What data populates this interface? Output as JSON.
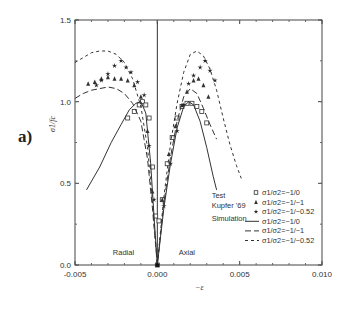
{
  "panel_label": "a)",
  "chart_data": {
    "type": "line",
    "title": "",
    "xlabel": "−ε",
    "ylabel": "σ1/fc",
    "xlim": [
      -0.005,
      0.01
    ],
    "ylim": [
      0.0,
      1.5
    ],
    "xticks": [
      -0.005,
      0.0,
      0.005,
      0.01
    ],
    "xtick_labels": [
      "-0.005",
      "0.000",
      "0.005",
      "0.010"
    ],
    "yticks": [
      0.0,
      0.5,
      1.0,
      1.5
    ],
    "ytick_labels": [
      "0.0",
      "0.5",
      "1.0",
      "1.5"
    ],
    "grid": false,
    "vertical_line_at": 0.0,
    "annotations": [
      {
        "text": "Radial",
        "x": -0.0027,
        "y": 0.06
      },
      {
        "text": "Axial",
        "x": 0.0013,
        "y": 0.06
      },
      {
        "text": "Test",
        "x": 0.0033,
        "y": 0.41
      },
      {
        "text": "Kupfer '69",
        "x": 0.0033,
        "y": 0.35
      },
      {
        "text": "Simulation",
        "x": 0.0033,
        "y": 0.27
      }
    ],
    "legend": {
      "position": "lower right",
      "entries": [
        {
          "label": "σ1/σ2=−1/0",
          "kind": "marker",
          "marker": "square"
        },
        {
          "label": "σ1/σ2=−1/−1",
          "kind": "marker",
          "marker": "triangle"
        },
        {
          "label": "σ1/σ2=−1/−0.52",
          "kind": "marker",
          "marker": "star"
        },
        {
          "label": "σ1/σ2=−1/0",
          "kind": "line",
          "dash": "solid"
        },
        {
          "label": "σ1/σ2=−1/−1",
          "kind": "line",
          "dash": "longdash"
        },
        {
          "label": "σ1/σ2=−1/−0.52",
          "kind": "line",
          "dash": "shortdash"
        }
      ]
    },
    "series": [
      {
        "name": "Test σ1/σ2=−1/0",
        "kind": "marker",
        "marker": "square",
        "x": [
          -0.0018,
          -0.0014,
          -0.0011,
          -0.0009,
          -0.0007,
          -0.0005,
          -0.0003,
          -0.0001,
          0.0,
          0.0001,
          0.0003,
          0.0006,
          0.0009,
          0.0012,
          0.0015,
          0.0018,
          0.0021,
          0.0024,
          0.0027,
          0.003
        ],
        "y": [
          0.9,
          0.94,
          0.98,
          1.0,
          0.98,
          0.9,
          0.6,
          0.3,
          0.0,
          0.27,
          0.4,
          0.62,
          0.78,
          0.9,
          0.97,
          0.99,
          0.99,
          0.97,
          0.94,
          0.87
        ]
      },
      {
        "name": "Test σ1/σ2=−1/−1",
        "kind": "marker",
        "marker": "triangle",
        "x": [
          -0.0042,
          -0.0038,
          -0.0034,
          -0.003,
          -0.0026,
          -0.0022,
          -0.0018,
          -0.0014,
          -0.001,
          -0.0006,
          -0.0003,
          0.0,
          0.0003,
          0.0007,
          0.0011,
          0.0015,
          0.0018,
          0.0022,
          0.0025,
          0.0028,
          0.0031
        ],
        "y": [
          1.11,
          1.12,
          1.14,
          1.15,
          1.14,
          1.14,
          1.13,
          1.1,
          1.03,
          0.82,
          0.45,
          0.0,
          0.4,
          0.68,
          0.85,
          0.98,
          1.06,
          1.13,
          1.14,
          1.1,
          1.03
        ]
      },
      {
        "name": "Test σ1/σ2=−1/−0.52",
        "kind": "marker",
        "marker": "star",
        "x": [
          -0.0037,
          -0.0034,
          -0.003,
          -0.0026,
          -0.0022,
          -0.0019,
          -0.0016,
          -0.0012,
          -0.0008,
          -0.0005,
          -0.0002,
          0.0,
          0.0004,
          0.0008,
          0.0012,
          0.0016,
          0.0019,
          0.0022,
          0.0026,
          0.0029,
          0.0032,
          0.0035
        ],
        "y": [
          1.1,
          1.13,
          1.17,
          1.22,
          1.25,
          1.21,
          1.18,
          1.12,
          1.04,
          0.73,
          0.4,
          0.0,
          0.36,
          0.62,
          0.82,
          0.98,
          1.11,
          1.16,
          1.21,
          1.25,
          1.19,
          1.13
        ]
      },
      {
        "name": "Simulation σ1/σ2=−1/0",
        "kind": "line",
        "dash": "solid",
        "x": [
          -0.0043,
          -0.0035,
          -0.0028,
          -0.0022,
          -0.0017,
          -0.0013,
          -0.001,
          -0.0007,
          -0.0004,
          -0.0002,
          0.0,
          0.0004,
          0.0008,
          0.0012,
          0.0016,
          0.0019,
          0.0022,
          0.0026,
          0.003,
          0.0034,
          0.0036
        ],
        "y": [
          0.46,
          0.6,
          0.75,
          0.86,
          0.95,
          0.99,
          1.0,
          0.93,
          0.62,
          0.3,
          0.0,
          0.35,
          0.62,
          0.84,
          0.97,
          1.0,
          0.98,
          0.88,
          0.72,
          0.54,
          0.46
        ]
      },
      {
        "name": "Simulation σ1/σ2=−1/−1",
        "kind": "line",
        "dash": "longdash",
        "x": [
          -0.005,
          -0.0045,
          -0.004,
          -0.0035,
          -0.003,
          -0.0025,
          -0.002,
          -0.0015,
          -0.001,
          -0.0006,
          -0.0003,
          0.0,
          0.0004,
          0.0008,
          0.0012,
          0.0016,
          0.002,
          0.0024,
          0.0028,
          0.0032,
          0.0036
        ],
        "y": [
          1.02,
          1.05,
          1.07,
          1.08,
          1.09,
          1.08,
          1.05,
          0.99,
          0.88,
          0.65,
          0.35,
          0.0,
          0.38,
          0.66,
          0.88,
          1.03,
          1.08,
          1.05,
          0.96,
          0.86,
          0.77
        ]
      },
      {
        "name": "Simulation σ1/σ2=−1/−0.52",
        "kind": "line",
        "dash": "shortdash",
        "x": [
          -0.005,
          -0.0045,
          -0.004,
          -0.0035,
          -0.003,
          -0.0025,
          -0.002,
          -0.0015,
          -0.001,
          -0.0006,
          -0.0003,
          0.0,
          0.0004,
          0.0008,
          0.0012,
          0.0016,
          0.002,
          0.0024,
          0.0028,
          0.0032,
          0.0036,
          0.004,
          0.0044,
          0.0048,
          0.0051
        ],
        "y": [
          1.24,
          1.27,
          1.3,
          1.31,
          1.31,
          1.29,
          1.24,
          1.14,
          0.97,
          0.72,
          0.4,
          0.0,
          0.42,
          0.74,
          0.99,
          1.18,
          1.29,
          1.31,
          1.28,
          1.2,
          1.07,
          0.9,
          0.74,
          0.61,
          0.53
        ]
      }
    ]
  }
}
